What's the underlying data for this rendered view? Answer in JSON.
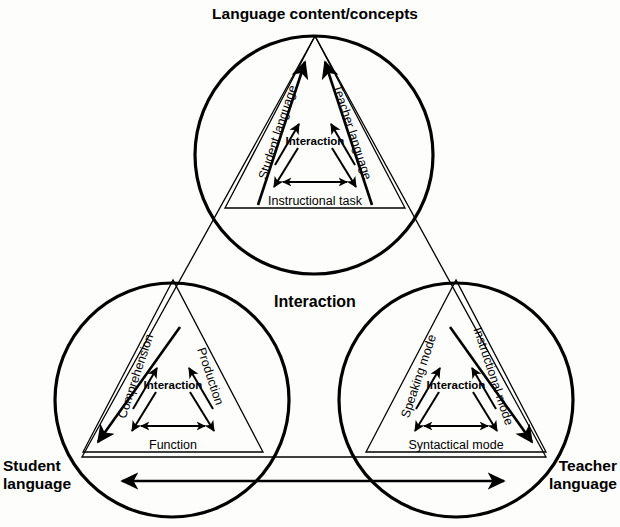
{
  "figure": {
    "title": "Language content/concepts",
    "center_label": "Interaction",
    "corners": {
      "top": "Language content/concepts",
      "bottom_left_line1": "Student",
      "bottom_left_line2": "language",
      "bottom_right_line1": "Teacher",
      "bottom_right_line2": "language"
    },
    "nodes": [
      {
        "id": "top",
        "left_side": "Student language",
        "right_side": "Teacher language",
        "base": "Instructional task",
        "center": "Interaction"
      },
      {
        "id": "bottom-left",
        "left_side": "Comprehension",
        "right_side": "Production",
        "base": "Function",
        "center": "Interaction"
      },
      {
        "id": "bottom-right",
        "left_side": "Speaking mode",
        "right_side": "Instructional mode",
        "base": "Syntactical mode",
        "center": "Interaction"
      }
    ],
    "colors": {
      "ink": "#000000",
      "paper": "#fdfdfb"
    }
  }
}
